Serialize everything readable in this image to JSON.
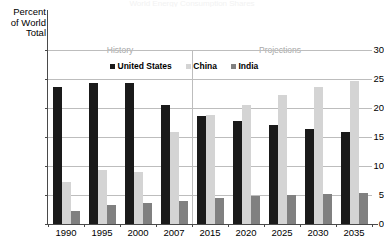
{
  "chart_data": {
    "type": "bar",
    "title": "World Energy Consumption Shares",
    "xlabel": "",
    "ylabel": "Percent of World Total",
    "ylabel_lines": [
      "Percent",
      "of World",
      "Total"
    ],
    "categories": [
      "1990",
      "1995",
      "2000",
      "2007",
      "2015",
      "2020",
      "2025",
      "2030",
      "2035"
    ],
    "ylim": [
      0,
      30
    ],
    "yticks": [
      0,
      5,
      10,
      15,
      20,
      25,
      30
    ],
    "ytick_labels": [
      "0",
      "5",
      "10",
      "15",
      "20",
      "25",
      "30"
    ],
    "grid": true,
    "legend_position": "top-center",
    "series": [
      {
        "name": "United States",
        "color": "#1a1a1a",
        "values": [
          23.7,
          24.3,
          24.3,
          20.6,
          18.7,
          17.8,
          17.1,
          16.4,
          15.8
        ]
      },
      {
        "name": "China",
        "color": "#d4d4d4",
        "values": [
          7.3,
          9.3,
          9.0,
          15.8,
          18.8,
          20.5,
          22.3,
          23.7,
          24.7
        ]
      },
      {
        "name": "India",
        "color": "#808080",
        "values": [
          2.2,
          3.2,
          3.6,
          4.0,
          4.5,
          4.8,
          5.0,
          5.1,
          5.3
        ]
      }
    ],
    "annotations": [
      {
        "name": "history",
        "text": "History"
      },
      {
        "name": "projections",
        "text": "Projections"
      }
    ]
  },
  "colors": {
    "united_states": "#1a1a1a",
    "china": "#d4d4d4",
    "india": "#808080",
    "gridline": "#bdbdbd",
    "axis": "#4a4a4a",
    "era_text": "#a8a8a8"
  }
}
